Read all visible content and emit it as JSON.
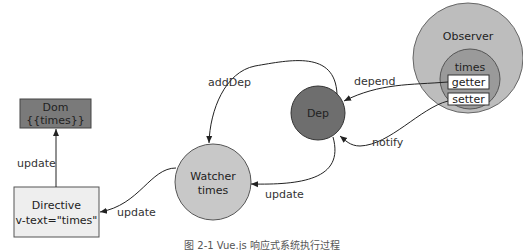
{
  "diagram": {
    "nodes": {
      "dom": {
        "title": "Dom",
        "subtitle": "{{times}}",
        "color": "#7a7a7a"
      },
      "directive": {
        "title": "Directive",
        "subtitle": "v-text=\"times\"",
        "color": "#eeeeee"
      },
      "watcher": {
        "title": "Watcher",
        "subtitle": "times",
        "color": "#c8c8c8"
      },
      "dep": {
        "title": "Dep",
        "color": "#6e6e6e"
      },
      "observer": {
        "title": "Observer",
        "color": "#bdbdbd"
      },
      "times": {
        "title": "times",
        "color": "#9a9a9a",
        "getter": "getter",
        "setter": "setter"
      }
    },
    "edges": {
      "directive_to_dom": "update",
      "watcher_to_directive": "update",
      "dep_to_watcher_add": "addDep",
      "dep_to_watcher_update": "update",
      "getter_to_dep": "depend",
      "setter_to_dep": "notify"
    },
    "caption": "图 2-1 Vue.js 响应式系统执行过程"
  }
}
